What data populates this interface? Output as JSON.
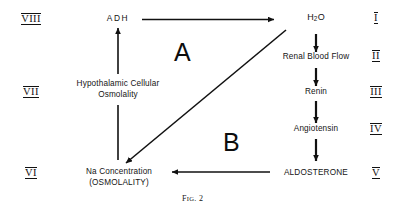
{
  "figure": {
    "caption_prefix": "F",
    "caption_smallcaps": "IG",
    "caption_suffix": ". 2"
  },
  "nodes": {
    "adh": {
      "label": "ADH"
    },
    "water": {
      "label_main": "H",
      "label_sub": "2",
      "label_tail": "O"
    },
    "renal_blood_flow": {
      "label": "Renal Blood Flow"
    },
    "renin": {
      "label": "Renin"
    },
    "angiotensin": {
      "label": "Angiotensin"
    },
    "aldosterone": {
      "label": "ALDOSTERONE"
    },
    "na_concentration": {
      "line1": "Na Concentration",
      "line2": "(OSMOLALITY)"
    },
    "hypothalamic_osmolality": {
      "line1": "Hypothalamic Cellular",
      "line2": "Osmolality"
    }
  },
  "zones": {
    "a": {
      "label": "A"
    },
    "b": {
      "label": "B"
    }
  },
  "numerals": {
    "left": [
      {
        "value": "VIII"
      },
      {
        "value": "VII"
      },
      {
        "value": "VI"
      }
    ],
    "right": [
      {
        "value": "I"
      },
      {
        "value": "II"
      },
      {
        "value": "III"
      },
      {
        "value": "IV"
      },
      {
        "value": "V"
      }
    ]
  },
  "colors": {
    "ink": "#111111",
    "background": "#ffffff"
  }
}
